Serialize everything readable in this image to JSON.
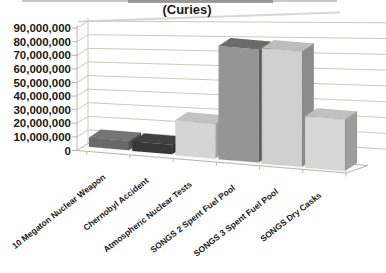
{
  "title": "(Curies)",
  "chart_data": {
    "type": "bar",
    "style": "3d-column-grayscale",
    "title": "(Curies)",
    "categories": [
      "10 Megaton Nuclear Weapon",
      "Chernobyl Accident",
      "Atmospheric Nuclear Tests",
      "SONGS 2 Spent Fuel Pool",
      "SONGS 3 Spent Fuel Pool",
      "SONGS Dry Casks"
    ],
    "values": [
      7000000,
      7000000,
      25000000,
      80000000,
      80000000,
      35000000
    ],
    "xlabel": "",
    "ylabel": "",
    "ylim": [
      0,
      90000000
    ],
    "ytick_step": 10000000,
    "ytick_labels": [
      "0",
      "10,000,000",
      "20,000,000",
      "30,000,000",
      "40,000,000",
      "50,000,000",
      "60,000,000",
      "70,000,000",
      "80,000,000",
      "90,000,000"
    ],
    "grid": true,
    "legend": "none",
    "background": "#ffffff",
    "gridline_color": "#ccc8bd",
    "axis_color": "#b9b5aa",
    "text_color": "#1a1a1a",
    "bar_colors": [
      {
        "front": "#686868",
        "top": "#757575",
        "side": "#525252"
      },
      {
        "front": "#373737",
        "top": "#414141",
        "side": "#2b2b2b"
      },
      {
        "front": "#d5d5d5",
        "top": "#c2c2c2",
        "side": "#a0a0a0"
      },
      {
        "front": "#959595",
        "top": "#6b6b6b",
        "side": "#606060"
      },
      {
        "front": "#d0d0d0",
        "top": "#bdbdbd",
        "side": "#8c8c8c"
      },
      {
        "front": "#d7d7d7",
        "top": "#c0c0c0",
        "side": "#9d9d9d"
      }
    ]
  }
}
